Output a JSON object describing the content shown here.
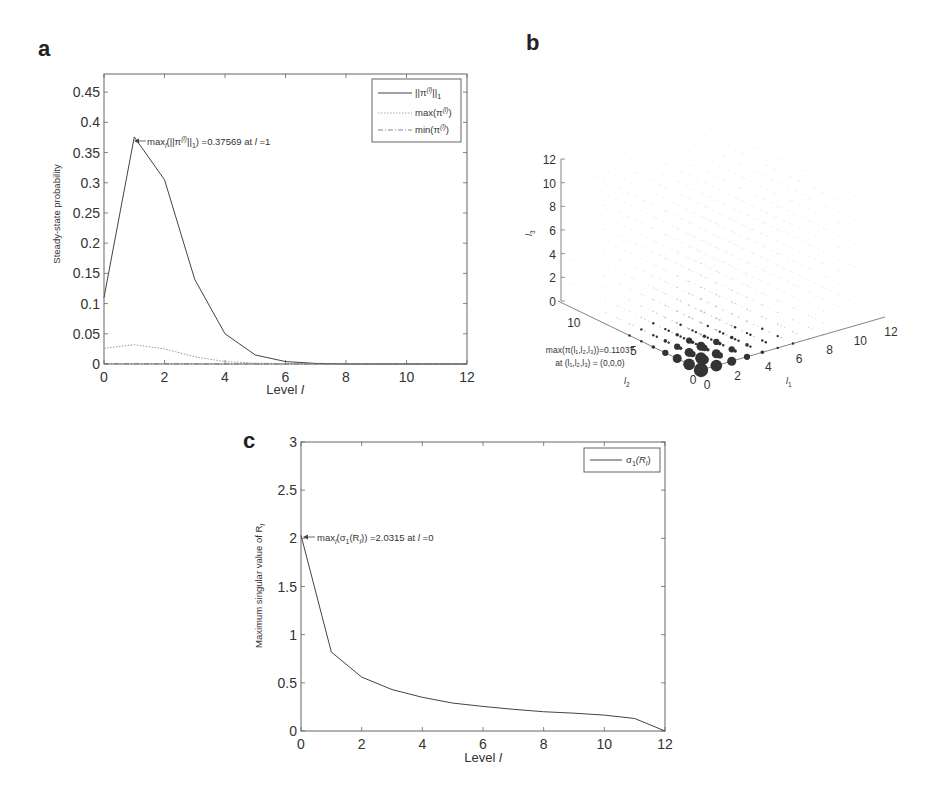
{
  "panels": {
    "a": {
      "letter": "a"
    },
    "b": {
      "letter": "b"
    },
    "c": {
      "letter": "c"
    }
  },
  "chart_data": [
    {
      "id": "a",
      "type": "line",
      "title": "",
      "xlabel": "Level l",
      "ylabel": "Steady-state probability",
      "xlim": [
        0,
        12
      ],
      "ylim": [
        0,
        0.48
      ],
      "xticks": [
        0,
        2,
        4,
        6,
        8,
        10,
        12
      ],
      "yticks": [
        0,
        0.05,
        0.1,
        0.15,
        0.2,
        0.25,
        0.3,
        0.35,
        0.4,
        0.45
      ],
      "ytick_labels": [
        "0",
        "0.05",
        "0.1",
        "0.15",
        "0.2",
        "0.25",
        "0.3",
        "0.35",
        "0.4",
        "0.45"
      ],
      "grid": false,
      "legend_position": "upper right",
      "x": [
        0,
        1,
        2,
        3,
        4,
        5,
        6,
        7,
        8,
        9,
        10,
        11,
        12
      ],
      "series": [
        {
          "name": "||π^(l)||_1",
          "style": "solid",
          "color": "#444444",
          "values": [
            0.11,
            0.37569,
            0.305,
            0.14,
            0.05,
            0.015,
            0.004,
            0.001,
            0.0,
            0.0,
            0.0,
            0.0,
            0.0
          ]
        },
        {
          "name": "max(π^(l))",
          "style": "dotted",
          "color": "#999999",
          "values": [
            0.026,
            0.032,
            0.025,
            0.012,
            0.004,
            0.0015,
            0.0005,
            0.0001,
            0.0,
            0.0,
            0.0,
            0.0,
            0.0
          ]
        },
        {
          "name": "min(π^(l))",
          "style": "dashdot",
          "color": "#777777",
          "values": [
            0.0005,
            0.0004,
            0.0003,
            0.0002,
            0.0001,
            0.0,
            0.0,
            0.0,
            0.0,
            0.0,
            0.0,
            0.0,
            0.0
          ]
        }
      ],
      "annotations": [
        {
          "text": "max_l(||π^(l)||_1) =0.37569 at l =1",
          "x": 1,
          "y": 0.37569,
          "arrow": true
        }
      ]
    },
    {
      "id": "b",
      "type": "scatter",
      "title": "",
      "xlabel": "l1",
      "ylabel": "l2",
      "zlabel": "l3",
      "xlim": [
        0,
        12
      ],
      "ylim": [
        0,
        12
      ],
      "zlim": [
        0,
        12
      ],
      "xticks": [
        0,
        2,
        4,
        6,
        8,
        10,
        12
      ],
      "yticks": [
        0,
        5,
        10
      ],
      "zticks": [
        0,
        2,
        4,
        6,
        8,
        10,
        12
      ],
      "grid": false,
      "marker_size_encodes": "π(l1,l2,l3)",
      "largest_points": [
        {
          "l1": 0,
          "l2": 0,
          "l3": 0,
          "size": 0.11037
        },
        {
          "l1": 1,
          "l2": 0,
          "l3": 0,
          "size": 0.07
        },
        {
          "l1": 0,
          "l2": 1,
          "l3": 0,
          "size": 0.07
        },
        {
          "l1": 0,
          "l2": 0,
          "l3": 1,
          "size": 0.07
        },
        {
          "l1": 1,
          "l2": 1,
          "l3": 0,
          "size": 0.045
        },
        {
          "l1": 2,
          "l2": 0,
          "l3": 0,
          "size": 0.04
        },
        {
          "l1": 0,
          "l2": 2,
          "l3": 0,
          "size": 0.04
        }
      ],
      "annotations": [
        {
          "text": "max(π(l1,l2,l3))=0.11037",
          "line": 1
        },
        {
          "text": "at (l1,l2,l3) = (0,0,0)",
          "line": 2
        }
      ]
    },
    {
      "id": "c",
      "type": "line",
      "title": "",
      "xlabel": "Level l",
      "ylabel": "Maximum singular value of R_l",
      "xlim": [
        0,
        12
      ],
      "ylim": [
        0,
        3
      ],
      "xticks": [
        0,
        2,
        4,
        6,
        8,
        10,
        12
      ],
      "yticks": [
        0,
        0.5,
        1,
        1.5,
        2,
        2.5,
        3
      ],
      "ytick_labels": [
        "0",
        "0.5",
        "1",
        "1.5",
        "2",
        "2.5",
        "3"
      ],
      "grid": false,
      "legend_position": "upper right",
      "x": [
        0,
        1,
        2,
        3,
        4,
        5,
        6,
        7,
        8,
        9,
        10,
        11,
        12
      ],
      "series": [
        {
          "name": "σ_1(R_l)",
          "style": "solid",
          "color": "#444444",
          "values": [
            2.0315,
            0.82,
            0.56,
            0.43,
            0.35,
            0.29,
            0.255,
            0.225,
            0.2,
            0.185,
            0.165,
            0.13,
            0.0
          ]
        }
      ],
      "annotations": [
        {
          "text": "max_l(σ_1(R_l)) =2.0315 at l =0",
          "x": 0,
          "y": 2.0315,
          "arrow": true
        }
      ]
    }
  ],
  "labels": {
    "a": {
      "xlabel": "Level ",
      "xlabel_var": "l",
      "ylabel": "Steady-state probability",
      "legend": [
        {
          "main": "||π",
          "sup": "(l)",
          "tail": "||",
          "sub": "1"
        },
        {
          "main": "max(π",
          "sup": "(l)",
          "tail": ")",
          "sub": ""
        },
        {
          "main": "min(π",
          "sup": "(l)",
          "tail": ")",
          "sub": ""
        }
      ],
      "annotation": {
        "pre": "max",
        "sub": "l",
        "mid": "(||π",
        "sup": "(l)",
        "mid2": "||",
        "sub2": "1",
        "post": ") =0.37569 at ",
        "var": "l",
        "end": " =1"
      }
    },
    "b": {
      "annotation_line1": "max(π(l₁,l₂,l₃))=0.11037",
      "annotation_line2": "at (l₁,l₂,l₃) = (0,0,0)",
      "xlabel": "l",
      "xlabel_sub": "1",
      "ylabel": "l",
      "ylabel_sub": "2",
      "zlabel": "l",
      "zlabel_sub": "3"
    },
    "c": {
      "xlabel": "Level ",
      "xlabel_var": "l",
      "ylabel": "Maximum singular value of R",
      "ylabel_sub": "l",
      "legend": {
        "main": "σ",
        "sub": "1",
        "tail": "(R",
        "sub2": "l",
        "end": ")"
      },
      "annotation": {
        "pre": "max",
        "sub": "l",
        "mid": "(σ",
        "sub2": "1",
        "mid2": "(R",
        "sub3": "l",
        "post": ")) =2.0315 at ",
        "var": "l",
        "end": " =0"
      }
    }
  }
}
